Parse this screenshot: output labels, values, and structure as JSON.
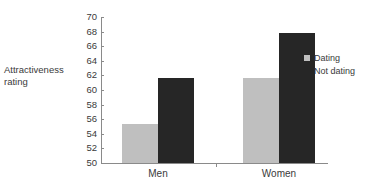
{
  "chart_data": {
    "type": "bar",
    "title": "",
    "subtitle": "",
    "xlabel": "",
    "ylabel": "Attractiveness\nrating",
    "categories": [
      "Men",
      "Women"
    ],
    "series": [
      {
        "name": "Dating",
        "color": "#bfbfbf",
        "values": [
          55.4,
          61.6
        ]
      },
      {
        "name": "Not dating",
        "color": "#262626",
        "values": [
          61.7,
          67.8
        ]
      }
    ],
    "ylim": [
      50,
      70
    ],
    "ytick_step": 2,
    "yticks": [
      "70",
      "68",
      "66",
      "64",
      "62",
      "60",
      "58",
      "56",
      "54",
      "52",
      "50"
    ],
    "grid": false,
    "legend_position": "right"
  },
  "axis": {
    "y_title": "Attractiveness\nrating",
    "axis_color": "#8a8a8a",
    "text_color": "#3a3a3a"
  },
  "legend": {
    "items": [
      {
        "label": "Dating",
        "swatch": "legend-swatch-dating"
      },
      {
        "label": "Not dating",
        "swatch": "legend-swatch-not-dating"
      }
    ]
  },
  "categories": [
    {
      "label": "Men"
    },
    {
      "label": "Women"
    }
  ]
}
